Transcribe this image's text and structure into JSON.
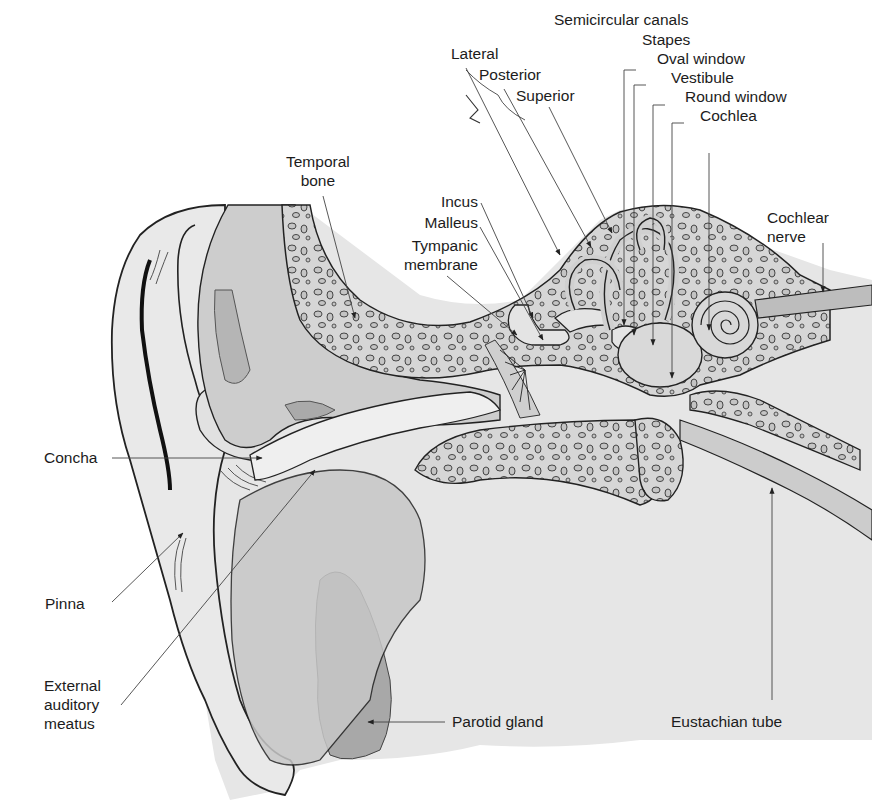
{
  "figure": {
    "colors": {
      "background": "#ffffff",
      "tissue_light": "#e3e3e3",
      "tissue_mid": "#c9c9c9",
      "tissue_dark": "#a9a9a9",
      "bone": "#d4d4d4",
      "outline": "#2a2a2a",
      "leader_line": "#444444"
    }
  },
  "labels": {
    "semicircular_canals": "Semicircular canals",
    "lateral": "Lateral",
    "posterior": "Posterior",
    "superior": "Superior",
    "stapes": "Stapes",
    "oval_window": "Oval window",
    "vestibule": "Vestibule",
    "round_window": "Round window",
    "cochlea": "Cochlea",
    "temporal_bone": [
      "Temporal",
      "bone"
    ],
    "incus": "Incus",
    "malleus": "Malleus",
    "tympanic_membrane": [
      "Tympanic",
      "membrane"
    ],
    "cochlear_nerve": [
      "Cochlear",
      "nerve"
    ],
    "concha": "Concha",
    "pinna": "Pinna",
    "external_auditory_meatus": [
      "External",
      "auditory",
      "meatus"
    ],
    "parotid_gland": "Parotid gland",
    "eustachian_tube": "Eustachian tube"
  }
}
